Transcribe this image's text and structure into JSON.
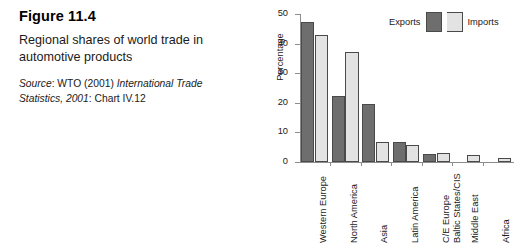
{
  "caption": {
    "figure_number": "Figure 11.4",
    "title": "Regional shares of world trade in automotive products",
    "source_prefix": "Source",
    "source_colon": ": WTO (2001) ",
    "source_italic_1": "International Trade Statistics, 2001",
    "source_suffix": ": Chart IV.12"
  },
  "chart_data": {
    "type": "bar",
    "title": "",
    "subtitle": "",
    "xlabel": "",
    "ylabel": "Percentage",
    "ylim": [
      0,
      50
    ],
    "yticks": [
      0,
      10,
      20,
      30,
      40,
      50
    ],
    "ytick_labels": [
      "0",
      "10",
      "20",
      "30",
      "40",
      "50"
    ],
    "grid": false,
    "legend_position": "top-right",
    "categories": [
      "Western Europe",
      "North America",
      "Asia",
      "Latin America",
      "C/E Europe Baltic States/CIS",
      "Middle East",
      "Africa"
    ],
    "category_lines": [
      [
        "Western Europe"
      ],
      [
        "North America"
      ],
      [
        "Asia"
      ],
      [
        "Latin America"
      ],
      [
        "C/E Europe",
        "Baltic States/CIS"
      ],
      [
        "Middle East"
      ],
      [
        "Africa"
      ]
    ],
    "series": [
      {
        "name": "Exports",
        "color": "#6e6e6e",
        "values": [
          47.2,
          22.3,
          19.7,
          6.9,
          2.8,
          0,
          0
        ]
      },
      {
        "name": "Imports",
        "color": "#e3e3e3",
        "values": [
          43.0,
          37.0,
          6.8,
          5.6,
          3.1,
          2.3,
          1.5
        ]
      }
    ]
  },
  "legend": {
    "exports_label": "Exports",
    "imports_label": "Imports"
  }
}
